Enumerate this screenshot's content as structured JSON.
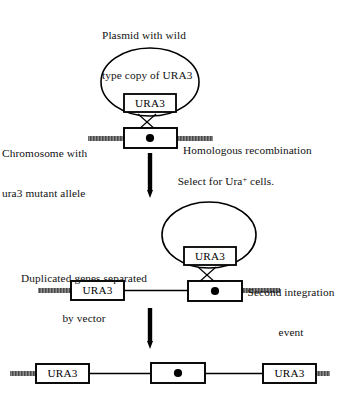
{
  "figure": {
    "width": 340,
    "height": 397,
    "background_color": "#ffffff",
    "ink_color": "#000000",
    "chromosome_arm_color": "#7a7a7a"
  },
  "captions": {
    "plasmid_title_line1": "Plasmid with wild",
    "plasmid_title_line2": "type copy of URA3",
    "chromosome_label_line1": "Chromosome with",
    "chromosome_label_line2": "ura3 mutant allele",
    "homologous_recombination": "Homologous recombination",
    "select_prefix": "Select for Ura",
    "select_superscript": "+",
    "select_suffix": " cells.",
    "duplicated_line1": "Duplicated genes separated",
    "duplicated_line2": "by vector",
    "second_event_line1": "Second integration",
    "second_event_line2": "event"
  },
  "gene_boxes": {
    "plasmid_ura3_step1": "URA3",
    "plasmid_ura3_step2": "URA3",
    "chromosome_ura3_step2": "URA3",
    "result_ura3_left": "URA3",
    "result_ura3_right": "URA3"
  },
  "stages": [
    {
      "id": "stage-1",
      "name": "initial-plasmid-and-chromosome",
      "plasmid_gene": "URA3",
      "chromosome_marker": "centromere-dot",
      "crossover": "single-X",
      "annotation": "Homologous recombination"
    },
    {
      "id": "stage-2",
      "name": "integrated-duplication",
      "plasmid_gene": "URA3",
      "chromosome_genes": [
        "URA3",
        "centromere-dot"
      ],
      "crossover": "single-X",
      "annotation": "Second integration event"
    },
    {
      "id": "stage-3",
      "name": "final-chromosome",
      "chromosome_genes": [
        "URA3",
        "centromere-dot",
        "URA3"
      ]
    }
  ],
  "arrows": [
    {
      "id": "arrow-1",
      "direction": "down",
      "label": "Select for Ura+ cells."
    },
    {
      "id": "arrow-2",
      "direction": "down",
      "label": ""
    }
  ]
}
